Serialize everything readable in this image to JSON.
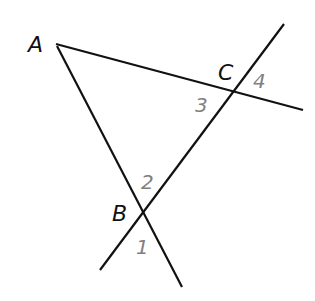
{
  "diagram": {
    "points": [
      {
        "name": "A",
        "x": 44,
        "y": 52
      },
      {
        "name": "C",
        "x": 229,
        "y": 80
      },
      {
        "name": "B",
        "x": 122,
        "y": 221
      }
    ],
    "angles": [
      {
        "label": "1",
        "x": 137,
        "y": 254
      },
      {
        "label": "2",
        "x": 143,
        "y": 192
      },
      {
        "label": "3",
        "x": 203,
        "y": 113
      },
      {
        "label": "4",
        "x": 255,
        "y": 89
      }
    ],
    "colors": {
      "line": "#111111",
      "point_label": "#111111",
      "angle_label": "#808080"
    }
  }
}
